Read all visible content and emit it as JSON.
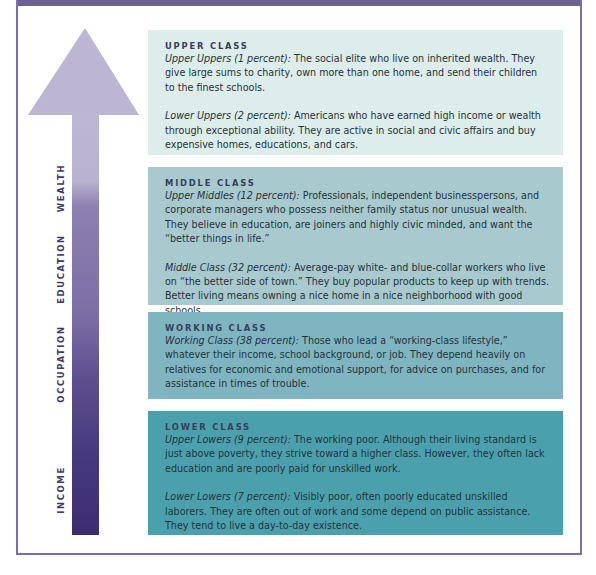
{
  "colors": {
    "frame": "#7d6fa0",
    "arrow_top": "#bcb6d2",
    "arrow_bottom": "#3e2f72",
    "upper_class_bg": "#dcedec",
    "middle_class_bg": "#a8cace",
    "working_class_bg": "#7fb5c1",
    "lower_class_bg": "#4aa1ad"
  },
  "arrow": {
    "icon": "up-arrow-icon",
    "labels": [
      "WEALTH",
      "EDUCATION",
      "OCCUPATION",
      "INCOME"
    ]
  },
  "classes": [
    {
      "title": "UPPER CLASS",
      "entries": [
        {
          "term": "Upper Uppers (1 percent):",
          "text": " The social elite who live on inherited wealth. They give large sums to charity, own more than one home, and send their children to the finest schools."
        },
        {
          "term": "Lower Uppers (2 percent):",
          "text": " Americans who have earned high income or wealth through exceptional ability. They are active in social and civic affairs and buy expensive homes, educations, and cars."
        }
      ]
    },
    {
      "title": "MIDDLE CLASS",
      "entries": [
        {
          "term": "Upper Middles (12 percent):",
          "text": " Professionals, independent businesspersons, and corporate managers who possess neither family status nor unusual wealth. They believe in education, are joiners and highly civic minded, and want the “better things in life.”"
        },
        {
          "term": "Middle Class (32 percent):",
          "text": " Average-pay white- and blue-collar workers who live on “the better side of town.” They buy popular products to keep up with trends. Better living means owning a nice home in a nice neighborhood with good schools."
        }
      ]
    },
    {
      "title": "WORKING CLASS",
      "entries": [
        {
          "term": "Working Class (38 percent):",
          "text": " Those who lead a “working-class lifestyle,” whatever their income, school background, or job. They depend heavily on relatives for economic and emotional support, for advice on purchases, and for assistance in times of trouble."
        }
      ]
    },
    {
      "title": "LOWER CLASS",
      "entries": [
        {
          "term": "Upper Lowers (9 percent):",
          "text": " The working poor. Although their living standard is just above poverty, they strive toward a higher class. However, they often lack education and are poorly paid for unskilled work."
        },
        {
          "term": "Lower Lowers (7 percent):",
          "text": " Visibly poor, often poorly educated unskilled laborers. They are often out of work and some depend on public assistance. They tend to live a day-to-day existence."
        }
      ]
    }
  ]
}
